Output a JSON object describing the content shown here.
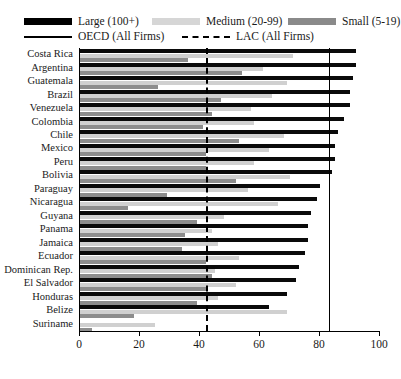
{
  "chart_data": {
    "type": "bar",
    "orientation": "horizontal",
    "title": "",
    "xlabel": "",
    "ylabel": "",
    "xlim": [
      0,
      100
    ],
    "xticks": [
      0,
      20,
      40,
      60,
      80,
      100
    ],
    "grid": false,
    "legend_position": "top",
    "categories": [
      "Costa Rica",
      "Argentina",
      "Guatemala",
      "Brazil",
      "Venezuela",
      "Colombia",
      "Chile",
      "Mexico",
      "Peru",
      "Bolivia",
      "Paraguay",
      "Nicaragua",
      "Guyana",
      "Panama",
      "Jamaica",
      "Ecuador",
      "Dominican Rep.",
      "El Salvador",
      "Honduras",
      "Belize",
      "Suriname"
    ],
    "series": [
      {
        "name": "Large (100+)",
        "color": "#0a0a0a",
        "values": [
          92,
          92,
          91,
          90,
          90,
          88,
          86,
          85,
          85,
          84,
          80,
          79,
          77,
          76,
          76,
          75,
          73,
          72,
          69,
          63,
          0
        ]
      },
      {
        "name": "Medium (20-99)",
        "color": "#d0d0d0",
        "values": [
          71,
          61,
          69,
          64,
          57,
          58,
          68,
          63,
          58,
          70,
          56,
          66,
          48,
          44,
          46,
          53,
          45,
          52,
          46,
          69,
          25
        ]
      },
      {
        "name": "Small (5-19)",
        "color": "#8d8d8d",
        "values": [
          36,
          54,
          26,
          47,
          44,
          41,
          53,
          42,
          42,
          52,
          29,
          16,
          39,
          35,
          34,
          42,
          44,
          42,
          39,
          18,
          4
        ]
      }
    ],
    "reference_lines": [
      {
        "name": "OECD (All Firms)",
        "value": 83,
        "style": "solid",
        "color": "#000000"
      },
      {
        "name": "LAC (All Firms)",
        "value": 42,
        "style": "dashed",
        "color": "#000000"
      }
    ]
  },
  "legend": {
    "items": [
      {
        "label": "Large (100+)",
        "type": "swatch",
        "key": "large"
      },
      {
        "label": "Medium (20-99)",
        "type": "swatch",
        "key": "medium"
      },
      {
        "label": "Small (5-19)",
        "type": "swatch",
        "key": "small"
      },
      {
        "label": "OECD (All Firms)",
        "type": "line-solid",
        "key": "oecd"
      },
      {
        "label": "LAC (All Firms)",
        "type": "line-dashed",
        "key": "lac"
      }
    ]
  }
}
